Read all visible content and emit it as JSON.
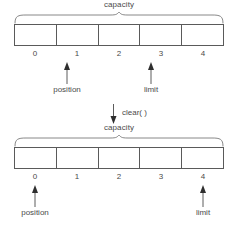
{
  "diagram": {
    "colors": {
      "background": "#ffffff",
      "stroke": "#5a5a5a",
      "text": "#4a4a4a"
    },
    "before": {
      "capacity_label": "capacity",
      "indices": [
        "0",
        "1",
        "2",
        "3",
        "4"
      ],
      "markers": [
        {
          "label": "position",
          "index": 1
        },
        {
          "label": "limit",
          "index": 3
        }
      ]
    },
    "operation": {
      "label": "clear( )",
      "arrow": "down-arrow-icon"
    },
    "after": {
      "capacity_label": "capacity",
      "indices": [
        "0",
        "1",
        "2",
        "3",
        "4"
      ],
      "markers": [
        {
          "label": "position",
          "index": 0
        },
        {
          "label": "limit",
          "index": 4
        }
      ]
    }
  }
}
